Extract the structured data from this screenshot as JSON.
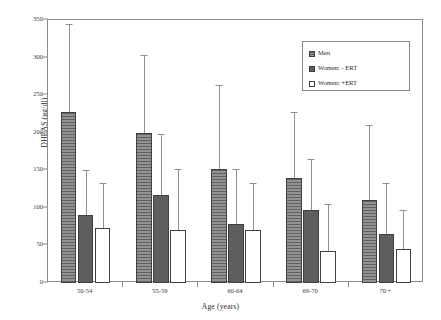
{
  "chart_data": {
    "type": "bar",
    "title": "",
    "xlabel": "Age (years)",
    "ylabel": "DHEAS (ug/dl)",
    "ylim": [
      0,
      350
    ],
    "yticks": [
      0,
      50,
      100,
      150,
      200,
      250,
      300,
      350
    ],
    "grid": false,
    "legend_position": "top-right",
    "categories": [
      "50-54",
      "55-59",
      "60-64",
      "69-70",
      "70 +"
    ],
    "series": [
      {
        "name": "Men",
        "color": "#8e8e8e",
        "pattern": "horizontal-hatch",
        "values": [
          228,
          200,
          152,
          140,
          110
        ],
        "error_upper": [
          345,
          303,
          263,
          228,
          210
        ]
      },
      {
        "name": "Women: - ERT",
        "color": "#5e5e5e",
        "pattern": "solid",
        "values": [
          90,
          117,
          78,
          97,
          65
        ],
        "error_upper": [
          150,
          198,
          152,
          165,
          133
        ]
      },
      {
        "name": "Women: +ERT",
        "color": "#ffffff",
        "pattern": "open",
        "values": [
          73,
          70,
          70,
          43,
          45
        ],
        "error_upper": [
          133,
          152,
          133,
          105,
          97
        ]
      }
    ]
  },
  "axes": {
    "y_label": "DHEAS (ug/dl)",
    "x_label": "Age (years)",
    "y_tick_labels": [
      "0",
      "50",
      "100",
      "150",
      "200",
      "250",
      "300",
      "350"
    ],
    "x_tick_labels": [
      "50-54",
      "55-59",
      "60-64",
      "69-70",
      "70 +"
    ]
  },
  "legend": {
    "entries": [
      {
        "label": "Men",
        "swatch": "men"
      },
      {
        "label": "Women: - ERT",
        "swatch": "wnoert"
      },
      {
        "label": "Women: +ERT",
        "swatch": "wert"
      }
    ]
  }
}
